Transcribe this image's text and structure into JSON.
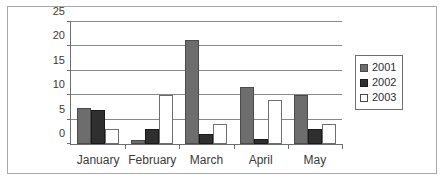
{
  "chart_data": {
    "type": "bar",
    "title": "",
    "subtitle": "",
    "xlabel": "",
    "ylabel": "",
    "categories": [
      "January",
      "February",
      "March",
      "April",
      "May"
    ],
    "series": [
      {
        "name": "2001",
        "color": "#6d6d6d",
        "values": [
          7.3,
          0.8,
          21.3,
          11.6,
          10.0
        ]
      },
      {
        "name": "2002",
        "color": "#2f2f2f",
        "values": [
          7.0,
          3.0,
          2.0,
          1.0,
          3.0
        ]
      },
      {
        "name": "2003",
        "color": "#ffffff",
        "values": [
          3.0,
          10.0,
          4.0,
          9.0,
          4.0
        ]
      }
    ],
    "ylim": [
      0,
      25
    ],
    "yticks": [
      0,
      5,
      10,
      15,
      20,
      25
    ],
    "ytick_labels": [
      "0",
      "5",
      "10",
      "15",
      "20",
      "25"
    ],
    "grid": true,
    "grid_axis": "y",
    "legend": {
      "position": "right",
      "entries": [
        "2001",
        "2002",
        "2003"
      ]
    }
  }
}
